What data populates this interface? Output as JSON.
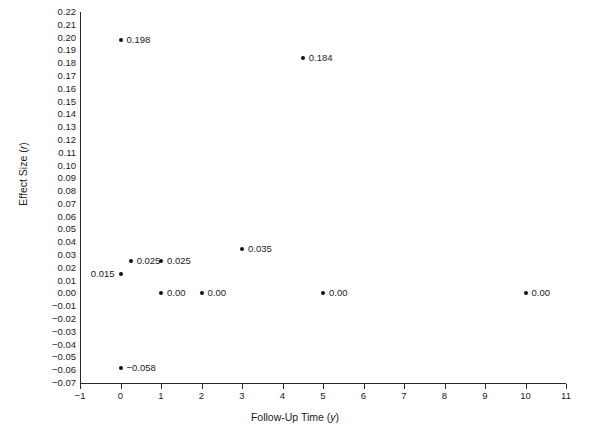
{
  "chart_data": {
    "type": "scatter",
    "title": "",
    "xlabel": "Follow-Up Time (y)",
    "ylabel": "Effect Size (r)",
    "xlim": [
      -1,
      11
    ],
    "ylim": [
      -0.07,
      0.22
    ],
    "grid": false,
    "legend": null,
    "xticks": [
      "−1",
      "0",
      "1",
      "2",
      "3",
      "4",
      "5",
      "6",
      "7",
      "8",
      "9",
      "10",
      "11"
    ],
    "xtick_values": [
      -1,
      0,
      1,
      2,
      3,
      4,
      5,
      6,
      7,
      8,
      9,
      10,
      11
    ],
    "yticks": [
      "0.22",
      "0.21",
      "0.20",
      "0.19",
      "0.18",
      "0.17",
      "0.16",
      "0.15",
      "0.14",
      "0.13",
      "0.12",
      "0.11",
      "0.10",
      "0.09",
      "0.08",
      "0.07",
      "0.06",
      "0.05",
      "0.04",
      "0.03",
      "0.02",
      "0.01",
      "0.00",
      "−0.01",
      "−0.02",
      "−0.03",
      "−0.04",
      "−0.05",
      "−0.06",
      "−0.07"
    ],
    "ytick_values": [
      0.22,
      0.21,
      0.2,
      0.19,
      0.18,
      0.17,
      0.16,
      0.15,
      0.14,
      0.13,
      0.12,
      0.11,
      0.1,
      0.09,
      0.08,
      0.07,
      0.06,
      0.05,
      0.04,
      0.03,
      0.02,
      0.01,
      0.0,
      -0.01,
      -0.02,
      -0.03,
      -0.04,
      -0.05,
      -0.06,
      -0.07
    ],
    "marker_color": "#111111",
    "axis_color": "#2a2a2a",
    "points": [
      {
        "x": 0,
        "y": 0.198,
        "label": "0.198",
        "label_side": "right"
      },
      {
        "x": 4.5,
        "y": 0.184,
        "label": "0.184",
        "label_side": "right"
      },
      {
        "x": 3,
        "y": 0.035,
        "label": "0.035",
        "label_side": "right"
      },
      {
        "x": 0.25,
        "y": 0.025,
        "label": "0.025",
        "label_side": "right"
      },
      {
        "x": 1,
        "y": 0.025,
        "label": "0.025",
        "label_side": "right"
      },
      {
        "x": 0,
        "y": 0.015,
        "label": "0.015",
        "label_side": "left"
      },
      {
        "x": 1,
        "y": 0.0,
        "label": "0.00",
        "label_side": "right"
      },
      {
        "x": 2,
        "y": 0.0,
        "label": "0.00",
        "label_side": "right"
      },
      {
        "x": 5,
        "y": 0.0,
        "label": "0.00",
        "label_side": "right"
      },
      {
        "x": 10,
        "y": 0.0,
        "label": "0.00",
        "label_side": "right"
      },
      {
        "x": 0,
        "y": -0.058,
        "label": "−0.058",
        "label_side": "right"
      }
    ]
  }
}
